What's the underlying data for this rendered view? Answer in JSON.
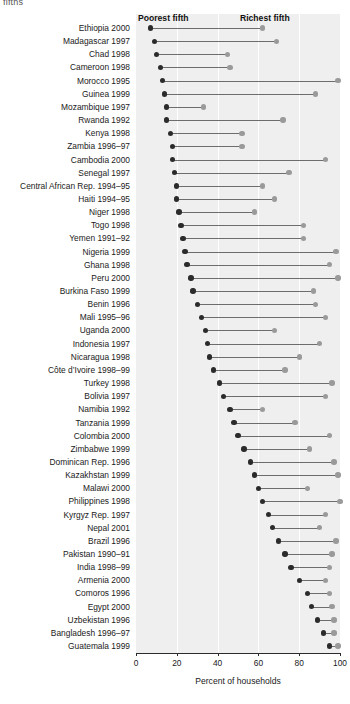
{
  "clipped_header": "fifths",
  "legend": {
    "poorest_label": "Poorest fifth",
    "richest_label": "Richest fifth"
  },
  "axis": {
    "title": "Percent of households",
    "ticks": [
      "0",
      "20",
      "40",
      "60",
      "80",
      "100"
    ]
  },
  "colors": {
    "plot_background": "#efefef",
    "gridline": "#ffffff",
    "poorest_dot": "#2b2b2b",
    "richest_dot": "#9a9a9a",
    "connector": "#6d6d6d",
    "axis": "#2b2b2b",
    "text": "#1a1a1a"
  },
  "chart_data": {
    "type": "scatter",
    "subtype": "dumbbell",
    "title": "",
    "xlabel": "Percent of households",
    "ylabel": "",
    "xlim": [
      0,
      100
    ],
    "xticks": [
      0,
      20,
      40,
      60,
      80,
      100
    ],
    "grid": true,
    "legend_position": "top-inside",
    "series": [
      {
        "name": "Poorest fifth",
        "color": "#2b2b2b"
      },
      {
        "name": "Richest fifth",
        "color": "#9a9a9a"
      }
    ],
    "categories": [
      "Ethiopia 2000",
      "Madagascar 1997",
      "Chad 1998",
      "Cameroon 1998",
      "Morocco 1995",
      "Guinea 1999",
      "Mozambique 1997",
      "Rwanda 1992",
      "Kenya 1998",
      "Zambia 1996–97",
      "Cambodia 2000",
      "Senegal 1997",
      "Central African Rep. 1994–95",
      "Haiti 1994–95",
      "Niger 1998",
      "Togo 1998",
      "Yemen 1991–92",
      "Nigeria 1999",
      "Ghana 1998",
      "Peru 2000",
      "Burkina Faso 1999",
      "Benin 1996",
      "Mali 1995–96",
      "Uganda 2000",
      "Indonesia 1997",
      "Nicaragua 1998",
      "Côte d’Ivoire 1998–99",
      "Turkey 1998",
      "Bolivia 1997",
      "Namibia 1992",
      "Tanzania 1999",
      "Colombia 2000",
      "Zimbabwe 1999",
      "Dominican Rep. 1996",
      "Kazakhstan 1999",
      "Malawi 2000",
      "Philippines 1998",
      "Kyrgyz Rep. 1997",
      "Nepal 2001",
      "Brazil 1996",
      "Pakistan 1990–91",
      "India 1998–99",
      "Armenia 2000",
      "Comoros 1996",
      "Egypt 2000",
      "Uzbekistan 1996",
      "Bangladesh 1996–97",
      "Guatemala 1999"
    ],
    "poorest": [
      7,
      9,
      10,
      12,
      13,
      14,
      15,
      15,
      17,
      18,
      18,
      19,
      20,
      20,
      21,
      22,
      23,
      24,
      25,
      27,
      28,
      30,
      32,
      34,
      35,
      36,
      38,
      41,
      43,
      46,
      48,
      50,
      53,
      56,
      58,
      60,
      62,
      65,
      67,
      70,
      73,
      76,
      80,
      84,
      86,
      89,
      92,
      95
    ],
    "richest": [
      62,
      69,
      45,
      46,
      99,
      88,
      33,
      72,
      52,
      52,
      93,
      75,
      62,
      68,
      58,
      82,
      82,
      98,
      95,
      99,
      87,
      88,
      93,
      68,
      90,
      80,
      73,
      96,
      93,
      62,
      78,
      95,
      85,
      97,
      99,
      84,
      100,
      93,
      90,
      98,
      96,
      95,
      93,
      95,
      96,
      97,
      97,
      99
    ]
  }
}
